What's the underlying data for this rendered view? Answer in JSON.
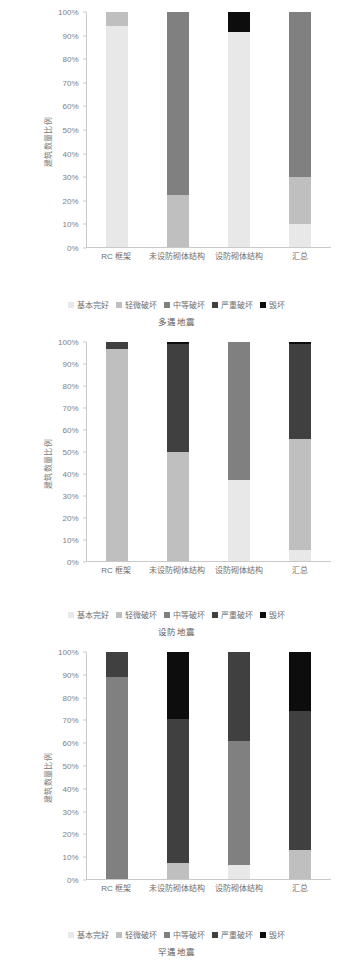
{
  "figure": {
    "ylabel": "建筑数量比例",
    "categories": [
      "RC 框架",
      "未设防砌体结构",
      "设防砌体结构",
      "汇总"
    ],
    "yticks": [
      "0%",
      "10%",
      "20%",
      "30%",
      "40%",
      "50%",
      "60%",
      "70%",
      "80%",
      "90%",
      "100%"
    ],
    "legend": [
      {
        "label": "基本完好",
        "color": "#e8e8e8"
      },
      {
        "label": "轻微破坏",
        "color": "#bfbfbf"
      },
      {
        "label": "中等破坏",
        "color": "#808080"
      },
      {
        "label": "严重破坏",
        "color": "#404040"
      },
      {
        "label": "毁坏",
        "color": "#0d0d0d"
      }
    ]
  },
  "chart_data": [
    {
      "type": "bar",
      "stacked": true,
      "title": "多遇地震",
      "xlabel": "",
      "ylabel": "建筑数量比例",
      "ylim": [
        0,
        100
      ],
      "grid": false,
      "legend_position": "bottom",
      "categories": [
        "RC 框架",
        "未设防砌体结构",
        "设防砌体结构",
        "汇总"
      ],
      "series": [
        {
          "name": "基本完好",
          "color": "#e8e8e8",
          "values": [
            94,
            0,
            91.5,
            10
          ]
        },
        {
          "name": "轻微破坏",
          "color": "#bfbfbf",
          "values": [
            6,
            22,
            0,
            20
          ]
        },
        {
          "name": "中等破坏",
          "color": "#808080",
          "values": [
            0,
            78,
            0,
            70
          ]
        },
        {
          "name": "严重破坏",
          "color": "#404040",
          "values": [
            0,
            0,
            0,
            0
          ]
        },
        {
          "name": "毁坏",
          "color": "#0d0d0d",
          "values": [
            0,
            0,
            8.5,
            0
          ]
        }
      ]
    },
    {
      "type": "bar",
      "stacked": true,
      "title": "设防地震",
      "xlabel": "",
      "ylabel": "建筑数量比例",
      "ylim": [
        0,
        100
      ],
      "grid": false,
      "legend_position": "bottom",
      "categories": [
        "RC 框架",
        "未设防砌体结构",
        "设防砌体结构",
        "汇总"
      ],
      "series": [
        {
          "name": "基本完好",
          "color": "#e8e8e8",
          "values": [
            0,
            0,
            37,
            5
          ]
        },
        {
          "name": "轻微破坏",
          "color": "#bfbfbf",
          "values": [
            97,
            50,
            0,
            50.5
          ]
        },
        {
          "name": "中等破坏",
          "color": "#808080",
          "values": [
            0,
            0,
            63,
            0
          ]
        },
        {
          "name": "严重破坏",
          "color": "#404040",
          "values": [
            3,
            49,
            0,
            43.5
          ]
        },
        {
          "name": "毁坏",
          "color": "#0d0d0d",
          "values": [
            0,
            1,
            0,
            1
          ]
        }
      ]
    },
    {
      "type": "bar",
      "stacked": true,
      "title": "罕遇地震",
      "xlabel": "",
      "ylabel": "建筑数量比例",
      "ylim": [
        0,
        100
      ],
      "grid": false,
      "legend_position": "bottom",
      "categories": [
        "RC 框架",
        "未设防砌体结构",
        "设防砌体结构",
        "汇总"
      ],
      "series": [
        {
          "name": "基本完好",
          "color": "#e8e8e8",
          "values": [
            0,
            0,
            6,
            0
          ]
        },
        {
          "name": "轻微破坏",
          "color": "#bfbfbf",
          "values": [
            0,
            7,
            0,
            13
          ]
        },
        {
          "name": "中等破坏",
          "color": "#808080",
          "values": [
            89,
            0,
            55,
            0
          ]
        },
        {
          "name": "严重破坏",
          "color": "#404040",
          "values": [
            11,
            63.5,
            39,
            61
          ]
        },
        {
          "name": "毁坏",
          "color": "#0d0d0d",
          "values": [
            0,
            29.5,
            0,
            26
          ]
        }
      ]
    }
  ]
}
